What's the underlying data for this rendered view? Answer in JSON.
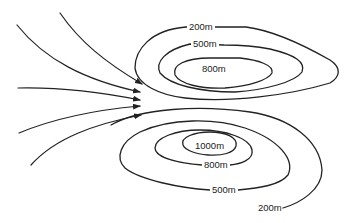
{
  "diagram": {
    "type": "topographic contour map with wind flow arrows",
    "colors": {
      "line": "#222222",
      "background": "#ffffff"
    },
    "north_hill": {
      "contours": [
        {
          "label": "200m"
        },
        {
          "label": "500m"
        },
        {
          "label": "800m"
        }
      ]
    },
    "south_hill": {
      "contours": [
        {
          "label": "1000m"
        },
        {
          "label": "800m"
        },
        {
          "label": "500m"
        },
        {
          "label": "200m"
        }
      ]
    },
    "arrows": {
      "count": 5,
      "direction": "converging toward gap between hills"
    }
  }
}
